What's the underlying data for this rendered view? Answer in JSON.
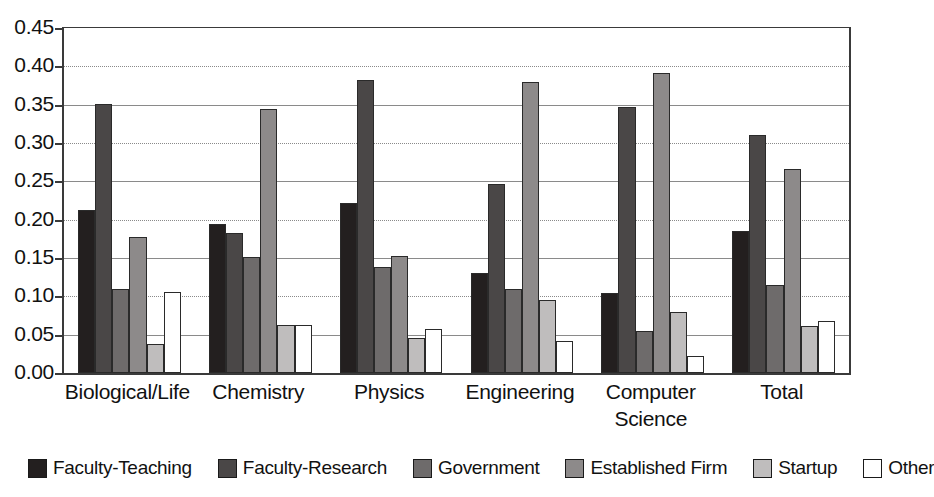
{
  "chart_data": {
    "type": "bar",
    "title": "",
    "subtitle": "",
    "xlabel": "",
    "ylabel": "",
    "ylim": [
      0.0,
      0.45
    ],
    "ytick_labels": [
      "0.45",
      "0.40",
      "0.35",
      "0.30",
      "0.25",
      "0.20",
      "0.15",
      "0.10",
      "0.05",
      "0.00"
    ],
    "ytick_values": [
      0.45,
      0.4,
      0.35,
      0.3,
      0.25,
      0.2,
      0.15,
      0.1,
      0.05,
      0.0
    ],
    "grid": true,
    "legend_position": "bottom",
    "categories": [
      "Biological/Life",
      "Chemistry",
      "Physics",
      "Engineering",
      "Computer\nScience",
      "Total"
    ],
    "series": [
      {
        "name": "Faculty-Teaching",
        "color": "#231f1f",
        "values": [
          0.213,
          0.195,
          0.222,
          0.13,
          0.104,
          0.185
        ]
      },
      {
        "name": "Faculty-Research",
        "color": "#4a4747",
        "values": [
          0.351,
          0.183,
          0.382,
          0.246,
          0.347,
          0.31
        ]
      },
      {
        "name": "Government",
        "color": "#6e6b6b",
        "values": [
          0.109,
          0.151,
          0.138,
          0.109,
          0.055,
          0.115
        ]
      },
      {
        "name": "Established Firm",
        "color": "#8d8a8a",
        "values": [
          0.178,
          0.344,
          0.153,
          0.38,
          0.391,
          0.266
        ]
      },
      {
        "name": "Startup",
        "color": "#bfbdbd",
        "values": [
          0.038,
          0.062,
          0.046,
          0.095,
          0.08,
          0.061
        ]
      },
      {
        "name": "Other",
        "color": "#ffffff",
        "values": [
          0.106,
          0.062,
          0.058,
          0.042,
          0.022,
          0.068
        ]
      }
    ]
  }
}
